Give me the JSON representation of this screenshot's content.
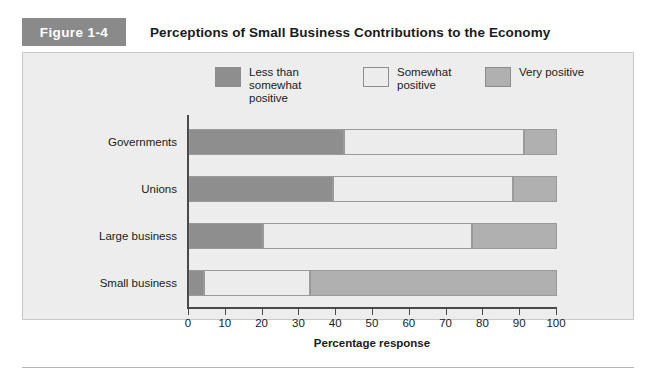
{
  "figure": {
    "badge": "Figure 1-4",
    "title": "Perceptions of Small Business Contributions to the Economy"
  },
  "chart_data": {
    "type": "bar",
    "orientation": "horizontal",
    "stacked": true,
    "title": "Perceptions of Small Business Contributions to the Economy",
    "xlabel": "Percentage response",
    "ylabel": "",
    "xlim": [
      0,
      100
    ],
    "xticks": [
      0,
      10,
      20,
      30,
      40,
      50,
      60,
      70,
      80,
      90,
      100
    ],
    "grid": false,
    "legend_position": "top",
    "categories": [
      "Governments",
      "Unions",
      "Large business",
      "Small business"
    ],
    "series": [
      {
        "name": "Less than somewhat positive",
        "color": "#8e8e8e",
        "values": [
          42,
          39,
          20,
          4
        ]
      },
      {
        "name": "Somewhat positive",
        "color": "#ececec",
        "values": [
          49,
          49,
          57,
          29
        ]
      },
      {
        "name": "Very positive",
        "color": "#b0b0b0",
        "values": [
          9,
          12,
          23,
          67
        ]
      }
    ],
    "cumulative_boundaries": [
      [
        42,
        91,
        100
      ],
      [
        39,
        88,
        100
      ],
      [
        20,
        77,
        100
      ],
      [
        4,
        33,
        100
      ]
    ]
  },
  "legend": [
    {
      "label": "Less than somewhat positive",
      "color": "#8e8e8e"
    },
    {
      "label": "Somewhat positive",
      "color": "#ececec"
    },
    {
      "label": "Very positive",
      "color": "#b0b0b0"
    }
  ],
  "axis": {
    "title": "Percentage response",
    "ticks": [
      "0",
      "10",
      "20",
      "30",
      "40",
      "50",
      "60",
      "70",
      "80",
      "90",
      "100"
    ]
  }
}
